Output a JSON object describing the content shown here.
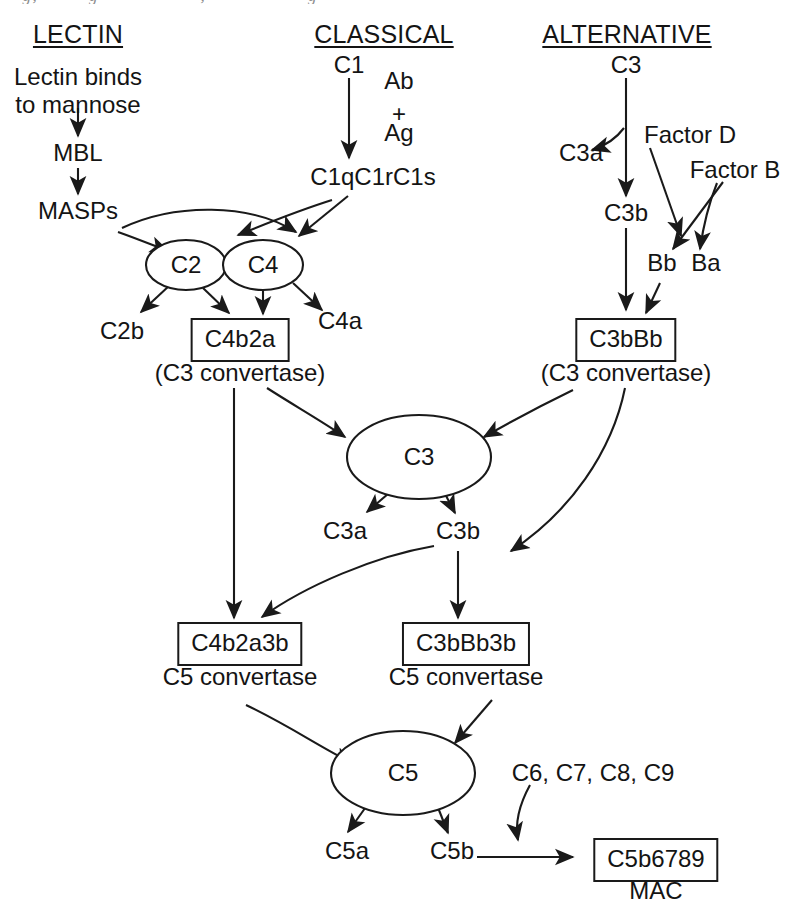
{
  "diagram": {
    "cropped_top_line": "Immunology and Microbiology, partially cropped running header",
    "ink_color": "#141414",
    "background_color": "#ffffff"
  },
  "headings": [
    {
      "id": "lectin",
      "label": "LECTIN"
    },
    {
      "id": "classical",
      "label": "CLASSICAL"
    },
    {
      "id": "alternative",
      "label": "ALTERNATIVE"
    }
  ],
  "lectin_pathway": {
    "initiator_line1": "Lectin binds",
    "initiator_line2": "to mannose",
    "mbl": "MBL",
    "masps": "MASPs"
  },
  "classical_pathway": {
    "c1": "C1",
    "ab": "Ab",
    "plus": "+",
    "ag": "Ag",
    "c1_complex": "C1qC1rC1s"
  },
  "alternative_pathway": {
    "c3": "C3",
    "c3a": "C3a",
    "c3b": "C3b",
    "factor_d": "Factor D",
    "factor_b": "Factor B",
    "bb": "Bb",
    "ba": "Ba"
  },
  "convertase_inputs": {
    "c2": "C2",
    "c4": "C4",
    "c2b": "C2b",
    "c4a": "C4a"
  },
  "c3_convertases": [
    {
      "id": "classical",
      "box_label": "C4b2a",
      "caption": "(C3 convertase)"
    },
    {
      "id": "alternative",
      "box_label": "C3bBb",
      "caption": "(C3 convertase)"
    }
  ],
  "central_c3": {
    "node": "C3",
    "c3a": "C3a",
    "c3b": "C3b"
  },
  "c5_convertases": [
    {
      "id": "classical",
      "box_label": "C4b2a3b",
      "caption": "C5 convertase"
    },
    {
      "id": "alternative",
      "box_label": "C3bBb3b",
      "caption": "C5 convertase"
    }
  ],
  "terminal": {
    "c5": "C5",
    "c5a": "C5a",
    "c5b": "C5b",
    "late_components": "C6, C7, C8, C9",
    "mac_box": "C5b6789",
    "mac_caption": "MAC"
  }
}
